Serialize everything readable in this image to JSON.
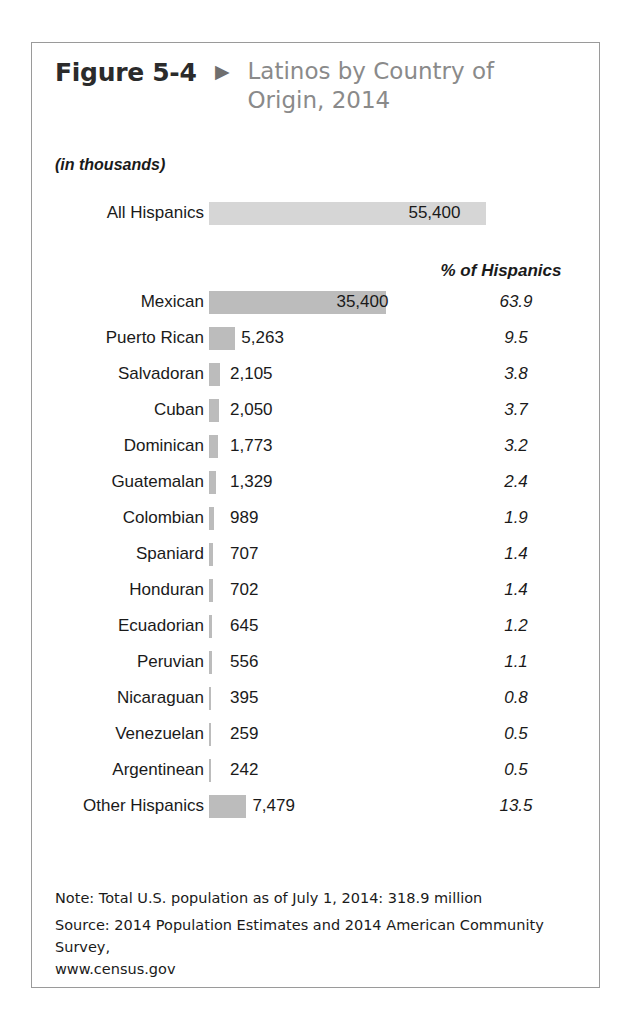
{
  "figure": {
    "number": "Figure 5-4",
    "arrow_icon": "triangle-right-icon",
    "title": "Latinos by Country of Origin, 2014",
    "units_caption": "(in thousands)",
    "pct_column_header": "% of Hispanics"
  },
  "footnotes": {
    "note": "Note: Total U.S. population as of July 1, 2014:  318.9 million",
    "source": "Source: 2014 Population Estimates and 2014 American Community Survey,",
    "source_url": "www.census.gov"
  },
  "colors": {
    "bar_primary": "#bcbcbc",
    "bar_light": "#d6d6d6",
    "frame_border": "#9a9a9a",
    "title_gray": "#8a8a8a",
    "text": "#1a1a1a"
  },
  "chart_data": {
    "type": "bar",
    "title": "Latinos by Country of Origin, 2014",
    "subtitle": "(in thousands)",
    "xlabel": "",
    "ylabel": "",
    "orientation": "horizontal",
    "grid": false,
    "legend": "none",
    "units": "thousands",
    "value_column_label": "",
    "pct_column_label": "% of Hispanics",
    "xlim": [
      0,
      55400
    ],
    "total_row": {
      "category": "All Hispanics",
      "value": 55400,
      "value_label": "55,400",
      "pct": null,
      "pct_label": "",
      "bar_style": "light"
    },
    "categories": [
      "Mexican",
      "Puerto Rican",
      "Salvadoran",
      "Cuban",
      "Dominican",
      "Guatemalan",
      "Colombian",
      "Spaniard",
      "Honduran",
      "Ecuadorian",
      "Peruvian",
      "Nicaraguan",
      "Venezuelan",
      "Argentinean",
      "Other Hispanics"
    ],
    "values": [
      35400,
      5263,
      2105,
      2050,
      1773,
      1329,
      989,
      707,
      702,
      645,
      556,
      395,
      259,
      242,
      7479
    ],
    "value_labels": [
      "35,400",
      "5,263",
      "2,105",
      "2,050",
      "1,773",
      "1,329",
      "989",
      "707",
      "702",
      "645",
      "556",
      "395",
      "259",
      "242",
      "7,479"
    ],
    "pct_values": [
      63.9,
      9.5,
      3.8,
      3.7,
      3.2,
      2.4,
      1.9,
      1.4,
      1.4,
      1.2,
      1.1,
      0.8,
      0.5,
      0.5,
      13.5
    ],
    "pct_labels": [
      "63.9",
      "9.5",
      "3.8",
      "3.7",
      "3.2",
      "2.4",
      "1.9",
      "1.4",
      "1.4",
      "1.2",
      "1.1",
      "0.8",
      "0.5",
      "0.5",
      "13.5"
    ]
  }
}
